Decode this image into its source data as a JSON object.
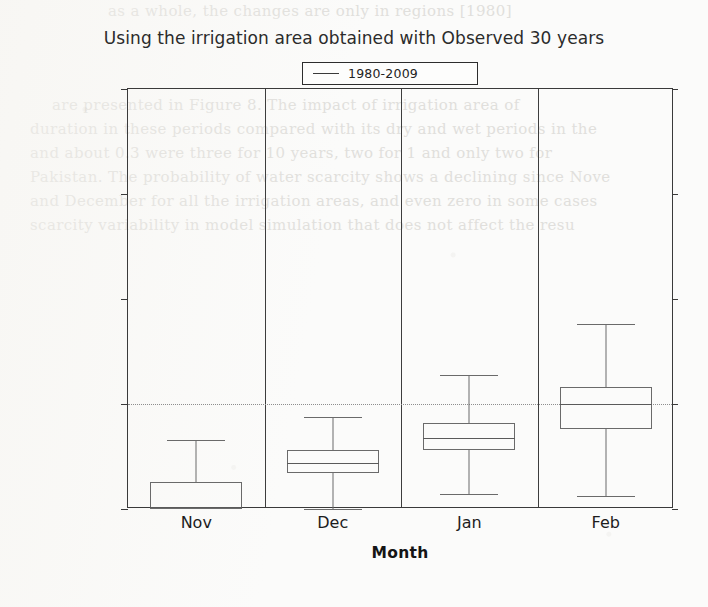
{
  "figure": {
    "title": "Using the irrigation area obtained with Observed 30 years",
    "legend": {
      "label": "1980-2009",
      "marker": "line-marker"
    },
    "axis": {
      "y_title": "Probability of water scarcity (-)",
      "x_title": "Month",
      "y_ticks": [
        "0.00",
        "0.25",
        "0.50",
        "0.75",
        "1.00"
      ],
      "x_ticks": [
        "Nov",
        "Dec",
        "Jan",
        "Feb"
      ]
    },
    "colors": {
      "page_background": "#fbfbfa",
      "frame": "#3a3a3a",
      "box_outline": "#6a6a6a",
      "reference_line": "#8e8e8e",
      "text": "#1d1d1d"
    }
  },
  "chart_data": {
    "type": "box",
    "title": "Using the irrigation area obtained with Observed 30 years",
    "xlabel": "Month",
    "ylabel": "Probability of water scarcity (-)",
    "categories": [
      "Nov",
      "Dec",
      "Jan",
      "Feb"
    ],
    "ylim": [
      0.0,
      1.0
    ],
    "yticks": [
      0.0,
      0.25,
      0.5,
      0.75,
      1.0
    ],
    "grid": false,
    "legend": [
      "1980-2009"
    ],
    "legend_position": "upper-center-above-axes",
    "reference_lines": [
      {
        "y": 0.25,
        "style": "dotted"
      }
    ],
    "panel_dividers": true,
    "series": [
      {
        "name": "1980-2009",
        "boxes": [
          {
            "category": "Nov",
            "min": 0.0,
            "q1": 0.0,
            "median": 0.005,
            "q3": 0.065,
            "max": 0.165
          },
          {
            "category": "Dec",
            "min": 0.0,
            "q1": 0.085,
            "median": 0.11,
            "q3": 0.14,
            "max": 0.22
          },
          {
            "category": "Jan",
            "min": 0.035,
            "q1": 0.14,
            "median": 0.17,
            "q3": 0.205,
            "max": 0.32
          },
          {
            "category": "Feb",
            "min": 0.03,
            "q1": 0.19,
            "median": 0.25,
            "q3": 0.29,
            "max": 0.44
          }
        ]
      }
    ]
  },
  "background_text": {
    "lines": [
      "as a whole, the changes are only in regions [1980]",
      "are presented in Figure 8. The impact of irrigation area of",
      "duration in these periods compared with its dry and wet periods in the",
      "and about 0.3 were three for 10 years, two for 1   and only two for",
      "Pakistan. The probability of water scarcity shows a declining since Nove",
      "and December for all the irrigation areas, and even zero in some cases",
      "scarcity variability in model simulation that does not affect the resu"
    ]
  }
}
